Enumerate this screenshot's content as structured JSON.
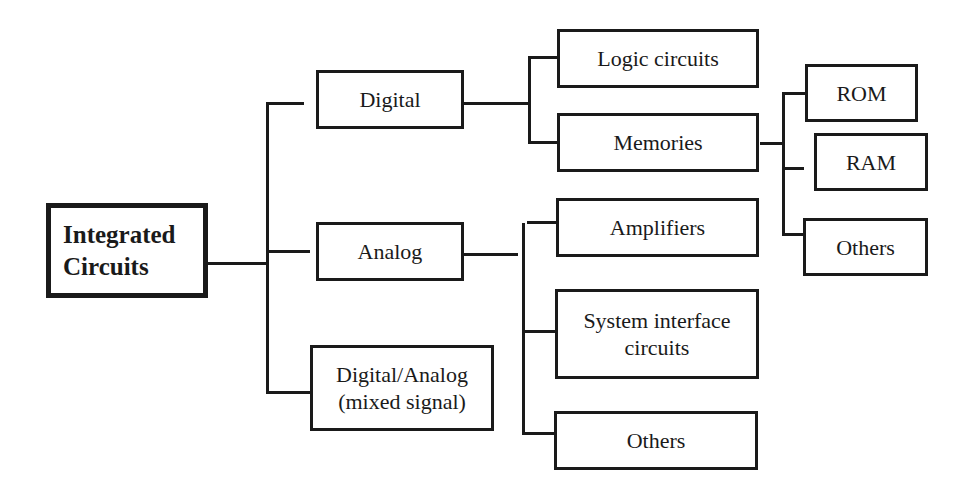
{
  "diagram": {
    "type": "hierarchy-tree",
    "root": {
      "label": "Integrated\nCircuits"
    },
    "branches": [
      {
        "label": "Digital",
        "children": [
          {
            "label": "Logic circuits"
          },
          {
            "label": "Memories",
            "children": [
              {
                "label": "ROM"
              },
              {
                "label": "RAM"
              },
              {
                "label": "Others"
              }
            ]
          }
        ]
      },
      {
        "label": "Analog",
        "children": [
          {
            "label": "Amplifiers"
          },
          {
            "label": "System interface\ncircuits"
          },
          {
            "label": "Others"
          }
        ]
      },
      {
        "label": "Digital/Analog\n(mixed signal)",
        "children": []
      }
    ]
  }
}
